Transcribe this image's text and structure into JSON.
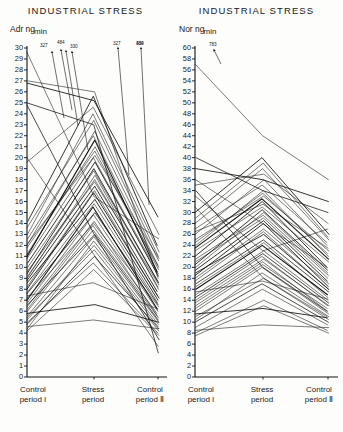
{
  "figure": {
    "panels": [
      {
        "id": "adr",
        "title": "INDUSTRIAL STRESS",
        "unit_prefix": "Adr ng",
        "unit_numerator": "ng",
        "unit_denominator": "min",
        "unit_label": "Adr ng/min"
      },
      {
        "id": "nor",
        "title": "INDUSTRIAL STRESS",
        "unit_prefix": "Nor ng",
        "unit_numerator": "ng",
        "unit_denominator": "min",
        "unit_label": "Nor ng/min"
      }
    ],
    "x_categories": [
      {
        "line1": "Control",
        "line2": "period I"
      },
      {
        "line1": "Stress",
        "line2": "period"
      },
      {
        "line1": "Control",
        "line2": "period Ⅱ"
      }
    ]
  },
  "chart_data": [
    {
      "type": "line",
      "id": "adrenaline",
      "title": "INDUSTRIAL STRESS",
      "ylabel": "Adr ng/min",
      "xlabel": "",
      "ylim": [
        0,
        30
      ],
      "ytick_step": 1,
      "yticks": [
        30,
        29,
        28,
        27,
        26,
        25,
        24,
        23,
        22,
        21,
        20,
        19,
        18,
        17,
        16,
        15,
        14,
        13,
        12,
        11,
        10,
        9,
        8,
        7,
        6,
        5,
        4,
        3,
        2,
        1,
        0
      ],
      "categories": [
        "Control period I",
        "Stress period",
        "Control period II"
      ],
      "grid": false,
      "legend": "none",
      "offscale_annotations": [
        {
          "label": "327",
          "at": "Control period I"
        },
        {
          "label": "484",
          "at": "Control period I"
        },
        {
          "label": "330",
          "at": "Control period I"
        },
        {
          "label": "327",
          "at": "Stress period"
        },
        {
          "label": "330",
          "at": "Stress period"
        },
        {
          "label": "484",
          "at": "Stress period"
        }
      ],
      "series": [
        {
          "name": "s1",
          "values": [
            7.0,
            15.5,
            6.2
          ]
        },
        {
          "name": "s2",
          "values": [
            6.4,
            14.2,
            5.6
          ]
        },
        {
          "name": "s3",
          "values": [
            8.2,
            17.0,
            7.4
          ]
        },
        {
          "name": "s4",
          "values": [
            9.0,
            18.4,
            8.0
          ]
        },
        {
          "name": "s5",
          "values": [
            5.6,
            12.8,
            5.0
          ]
        },
        {
          "name": "s6",
          "values": [
            10.4,
            19.6,
            9.2
          ]
        },
        {
          "name": "s7",
          "values": [
            11.2,
            21.0,
            9.8
          ]
        },
        {
          "name": "s8",
          "values": [
            4.8,
            11.0,
            4.4
          ]
        },
        {
          "name": "s9",
          "values": [
            12.0,
            22.4,
            10.6
          ]
        },
        {
          "name": "s10",
          "values": [
            6.8,
            14.8,
            6.0
          ]
        },
        {
          "name": "s11",
          "values": [
            8.6,
            16.2,
            7.0
          ]
        },
        {
          "name": "s12",
          "values": [
            13.0,
            24.0,
            11.4
          ]
        },
        {
          "name": "s13",
          "values": [
            5.2,
            12.0,
            4.6
          ]
        },
        {
          "name": "s14",
          "values": [
            9.6,
            17.8,
            8.4
          ]
        },
        {
          "name": "s15",
          "values": [
            7.6,
            15.0,
            6.6
          ]
        },
        {
          "name": "s16",
          "values": [
            14.2,
            25.6,
            12.0
          ]
        },
        {
          "name": "s17",
          "values": [
            4.2,
            9.8,
            3.8
          ]
        },
        {
          "name": "s18",
          "values": [
            10.0,
            18.8,
            8.8
          ]
        },
        {
          "name": "s19",
          "values": [
            6.0,
            13.4,
            5.4
          ]
        },
        {
          "name": "s20",
          "values": [
            11.8,
            20.6,
            10.0
          ]
        },
        {
          "name": "s21",
          "values": [
            8.0,
            16.8,
            7.2
          ]
        },
        {
          "name": "s22",
          "values": [
            25.0,
            23.0,
            2.2
          ]
        },
        {
          "name": "s23",
          "values": [
            27.0,
            26.0,
            9.0
          ]
        },
        {
          "name": "s24",
          "values": [
            19.6,
            24.6,
            13.0
          ]
        },
        {
          "name": "s25",
          "values": [
            5.0,
            10.4,
            4.0
          ]
        },
        {
          "name": "s26",
          "values": [
            9.4,
            19.0,
            8.6
          ]
        },
        {
          "name": "s27",
          "values": [
            7.2,
            14.0,
            6.4
          ]
        },
        {
          "name": "s28",
          "values": [
            12.6,
            22.0,
            10.2
          ]
        },
        {
          "name": "s29",
          "values": [
            6.6,
            13.0,
            5.2
          ]
        },
        {
          "name": "s30",
          "values": [
            10.8,
            20.0,
            9.4
          ]
        },
        {
          "name": "s31",
          "values": [
            8.8,
            17.4,
            7.8
          ]
        },
        {
          "name": "s32",
          "values": [
            4.4,
            12.4,
            4.8
          ]
        },
        {
          "name": "s33",
          "values": [
            13.6,
            23.4,
            11.0
          ]
        },
        {
          "name": "s34",
          "values": [
            7.8,
            15.8,
            6.8
          ]
        },
        {
          "name": "s35",
          "values": [
            5.4,
            11.6,
            4.2
          ]
        },
        {
          "name": "s36",
          "values": [
            11.0,
            21.6,
            9.6
          ]
        },
        {
          "name": "s37",
          "values": [
            9.2,
            18.0,
            8.2
          ]
        },
        {
          "name": "s38",
          "values": [
            6.2,
            13.8,
            5.8
          ]
        },
        {
          "name": "s39",
          "values": [
            12.2,
            20.2,
            10.8
          ]
        },
        {
          "name": "s40",
          "values": [
            4.6,
            5.2,
            4.4
          ]
        },
        {
          "name": "s41",
          "values": [
            5.8,
            6.6,
            5.0
          ]
        },
        {
          "name": "s42",
          "values": [
            7.4,
            8.6,
            6.2
          ]
        },
        {
          "name": "s43",
          "values": [
            24.8,
            13.0,
            3.4
          ]
        },
        {
          "name": "s44",
          "values": [
            20.0,
            11.2,
            2.8
          ]
        },
        {
          "name": "s45",
          "values": [
            29.6,
            16.4,
            12.6
          ]
        },
        {
          "name": "s46",
          "values": [
            26.8,
            25.2,
            14.6
          ]
        }
      ]
    },
    {
      "type": "line",
      "id": "noradrenaline",
      "title": "INDUSTRIAL STRESS",
      "ylabel": "Nor ng/min",
      "xlabel": "",
      "ylim": [
        0,
        60
      ],
      "ytick_step": 2,
      "yticks": [
        60,
        58,
        56,
        54,
        52,
        50,
        48,
        46,
        44,
        42,
        40,
        38,
        36,
        34,
        32,
        30,
        28,
        26,
        24,
        22,
        20,
        18,
        16,
        14,
        12,
        10,
        8,
        6,
        4,
        2,
        0
      ],
      "categories": [
        "Control period I",
        "Stress period",
        "Control period II"
      ],
      "grid": false,
      "legend": "none",
      "offscale_annotations": [
        {
          "label": "783",
          "at": "Control period I"
        }
      ],
      "series": [
        {
          "name": "n1",
          "values": [
            16.0,
            24.0,
            15.0
          ]
        },
        {
          "name": "n2",
          "values": [
            14.0,
            22.0,
            13.0
          ]
        },
        {
          "name": "n3",
          "values": [
            18.0,
            27.0,
            17.0
          ]
        },
        {
          "name": "n4",
          "values": [
            20.0,
            30.0,
            19.0
          ]
        },
        {
          "name": "n5",
          "values": [
            12.0,
            20.0,
            11.5
          ]
        },
        {
          "name": "n6",
          "values": [
            22.0,
            32.0,
            20.0
          ]
        },
        {
          "name": "n7",
          "values": [
            24.0,
            34.0,
            22.0
          ]
        },
        {
          "name": "n8",
          "values": [
            10.0,
            17.0,
            10.0
          ]
        },
        {
          "name": "n9",
          "values": [
            26.0,
            36.0,
            24.0
          ]
        },
        {
          "name": "n10",
          "values": [
            15.0,
            23.0,
            14.0
          ]
        },
        {
          "name": "n11",
          "values": [
            19.0,
            26.0,
            16.0
          ]
        },
        {
          "name": "n12",
          "values": [
            28.0,
            38.0,
            25.0
          ]
        },
        {
          "name": "n13",
          "values": [
            11.0,
            18.0,
            10.5
          ]
        },
        {
          "name": "n14",
          "values": [
            21.0,
            29.0,
            18.0
          ]
        },
        {
          "name": "n15",
          "values": [
            17.0,
            25.0,
            15.5
          ]
        },
        {
          "name": "n16",
          "values": [
            30.0,
            40.0,
            26.0
          ]
        },
        {
          "name": "n17",
          "values": [
            8.0,
            14.0,
            8.5
          ]
        },
        {
          "name": "n18",
          "values": [
            23.0,
            31.0,
            21.0
          ]
        },
        {
          "name": "n19",
          "values": [
            13.0,
            21.0,
            12.0
          ]
        },
        {
          "name": "n20",
          "values": [
            25.0,
            33.0,
            23.0
          ]
        },
        {
          "name": "n21",
          "values": [
            18.5,
            28.0,
            16.5
          ]
        },
        {
          "name": "n22",
          "values": [
            40.0,
            34.0,
            30.0
          ]
        },
        {
          "name": "n23",
          "values": [
            36.0,
            28.0,
            20.0
          ]
        },
        {
          "name": "n24",
          "values": [
            35.0,
            37.0,
            28.0
          ]
        },
        {
          "name": "n25",
          "values": [
            9.0,
            16.0,
            9.5
          ]
        },
        {
          "name": "n26",
          "values": [
            20.5,
            30.5,
            19.5
          ]
        },
        {
          "name": "n27",
          "values": [
            16.5,
            24.5,
            14.5
          ]
        },
        {
          "name": "n28",
          "values": [
            27.0,
            35.0,
            24.5
          ]
        },
        {
          "name": "n29",
          "values": [
            14.5,
            22.5,
            13.5
          ]
        },
        {
          "name": "n30",
          "values": [
            24.5,
            33.5,
            22.5
          ]
        },
        {
          "name": "n31",
          "values": [
            19.5,
            28.5,
            17.5
          ]
        },
        {
          "name": "n32",
          "values": [
            10.5,
            19.0,
            11.0
          ]
        },
        {
          "name": "n33",
          "values": [
            29.0,
            39.0,
            25.5
          ]
        },
        {
          "name": "n34",
          "values": [
            17.5,
            26.5,
            16.0
          ]
        },
        {
          "name": "n35",
          "values": [
            12.5,
            20.5,
            12.5
          ]
        },
        {
          "name": "n36",
          "values": [
            23.5,
            32.5,
            21.5
          ]
        },
        {
          "name": "n37",
          "values": [
            21.5,
            29.5,
            18.5
          ]
        },
        {
          "name": "n38",
          "values": [
            13.5,
            21.5,
            13.0
          ]
        },
        {
          "name": "n39",
          "values": [
            26.5,
            31.5,
            23.5
          ]
        },
        {
          "name": "n40",
          "values": [
            8.5,
            9.5,
            9.0
          ]
        },
        {
          "name": "n41",
          "values": [
            11.5,
            12.5,
            10.8
          ]
        },
        {
          "name": "n42",
          "values": [
            15.5,
            17.5,
            14.2
          ]
        },
        {
          "name": "n43",
          "values": [
            34.0,
            20.0,
            12.0
          ]
        },
        {
          "name": "n44",
          "values": [
            31.0,
            18.0,
            11.0
          ]
        },
        {
          "name": "n45",
          "values": [
            57.0,
            44.0,
            36.0
          ]
        },
        {
          "name": "n46",
          "values": [
            38.0,
            36.0,
            32.0
          ]
        },
        {
          "name": "n47",
          "values": [
            33.0,
            23.0,
            27.0
          ]
        },
        {
          "name": "n48",
          "values": [
            7.5,
            13.0,
            8.0
          ]
        }
      ]
    }
  ]
}
